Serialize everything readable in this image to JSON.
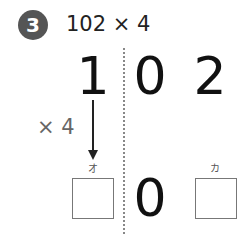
{
  "problem": {
    "number": "3",
    "expression": "102 × 4"
  },
  "digits": {
    "hundreds": "1",
    "tens": "0",
    "ones": "2"
  },
  "multiplier_label": "× 4",
  "answer": {
    "hundreds_label": "オ",
    "tens_value": "0",
    "ones_label": "カ",
    "hundreds_value": "",
    "ones_value": ""
  },
  "colors": {
    "badge": "#555555",
    "text": "#111111",
    "multiplier": "#666666",
    "divider": "#888888"
  }
}
